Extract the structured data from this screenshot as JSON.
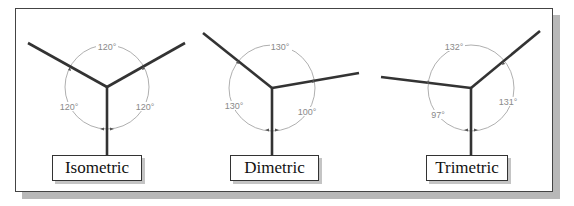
{
  "diagrams": [
    {
      "label": "Isometric",
      "angles": [
        {
          "text": "120°",
          "position": "top"
        },
        {
          "text": "120°",
          "position": "left"
        },
        {
          "text": "120°",
          "position": "right"
        }
      ]
    },
    {
      "label": "Dimetric",
      "angles": [
        {
          "text": "130°",
          "position": "top"
        },
        {
          "text": "130°",
          "position": "left"
        },
        {
          "text": "100°",
          "position": "right"
        }
      ]
    },
    {
      "label": "Trimetric",
      "angles": [
        {
          "text": "132°",
          "position": "top"
        },
        {
          "text": "97°",
          "position": "left"
        },
        {
          "text": "131°",
          "position": "right"
        }
      ]
    }
  ],
  "colors": {
    "axis": "#333333",
    "arc": "#9a9a9a",
    "angle_text": "#8a8a8a",
    "frame_shadow": "#b8b8b8"
  }
}
